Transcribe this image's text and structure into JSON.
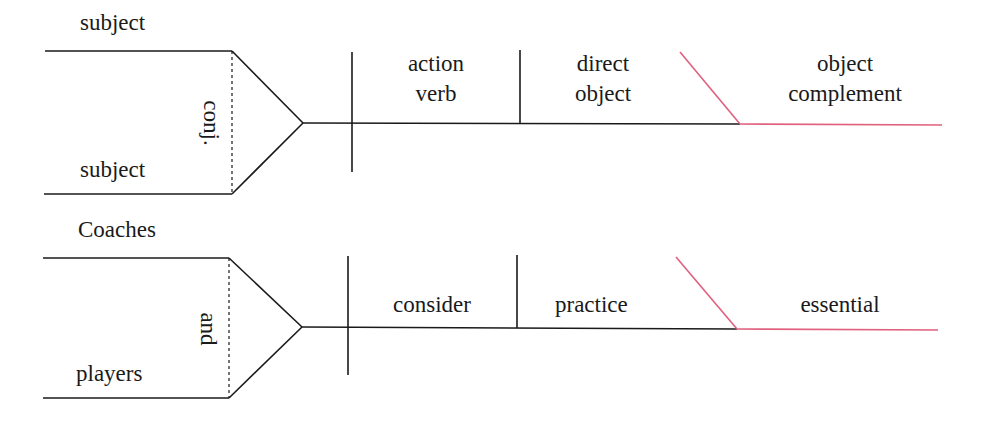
{
  "colors": {
    "line": "#1a1a1a",
    "complement_line": "#e0607e"
  },
  "template_diagram": {
    "subject_top": "subject",
    "subject_bottom": "subject",
    "conjunction": "conj.",
    "verb_line1": "action",
    "verb_line2": "verb",
    "direct_object_line1": "direct",
    "direct_object_line2": "object",
    "complement_line1": "object",
    "complement_line2": "complement"
  },
  "example_diagram": {
    "subject_top": "Coaches",
    "subject_bottom": "players",
    "conjunction": "and",
    "verb": "consider",
    "direct_object": "practice",
    "complement": "essential"
  }
}
